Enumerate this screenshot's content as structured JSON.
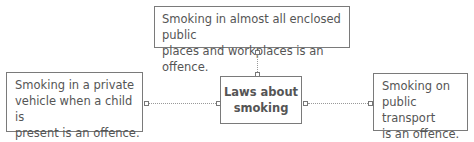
{
  "diagram": {
    "center": {
      "line1": "Laws about",
      "line2": "smoking"
    },
    "top": {
      "line1": "Smoking in almost all enclosed public",
      "line2": "places and workplaces is an offence."
    },
    "left": {
      "line1": "Smoking in a private",
      "line2": "vehicle when a child is",
      "line3": "present is an offence."
    },
    "right": {
      "line1": "Smoking on",
      "line2": "public transport",
      "line3": "is an offence."
    }
  }
}
